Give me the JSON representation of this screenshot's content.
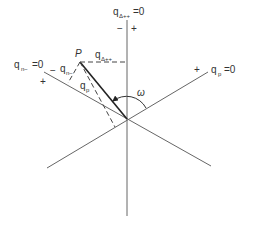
{
  "diagram": {
    "axes": {
      "vertical": {
        "label": "q",
        "subscript": "Δ++",
        "suffix": "=0",
        "minus_sign": "−",
        "plus_sign": "+"
      },
      "line_nminus": {
        "label": "q",
        "subscript": "n−",
        "suffix": "=0",
        "minus_sign": "−",
        "plus_sign": "+"
      },
      "line_p": {
        "label": "q",
        "subscript": "p",
        "suffix": "=0",
        "plus_sign": "+"
      }
    },
    "point": {
      "label": "P"
    },
    "projections": {
      "delta": {
        "label": "q",
        "subscript": "Δ++"
      },
      "nminus": {
        "label": "q",
        "subscript": "n−"
      },
      "p": {
        "label": "q",
        "subscript": "p"
      }
    },
    "angle": {
      "label": "ω"
    },
    "colors": {
      "line": "#555555",
      "bold_line": "#222222",
      "text": "#333333",
      "background": "#ffffff"
    }
  }
}
